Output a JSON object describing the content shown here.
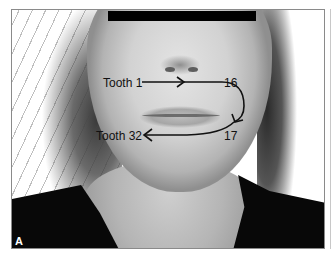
{
  "figure": {
    "panel_label": "A",
    "redaction": {
      "color": "#000000"
    },
    "labels": {
      "start": "Tooth 1",
      "upper_end": "16",
      "lower_start": "17",
      "end": "Tooth 32"
    },
    "colors": {
      "arrow": "#111111",
      "frame": "#8a8a8a",
      "shirt": "#080808",
      "skin": "#d2d2d2"
    }
  }
}
